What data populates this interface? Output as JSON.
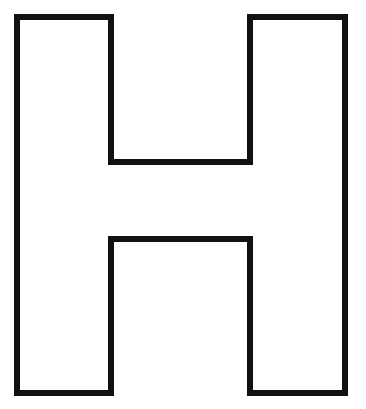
{
  "image": {
    "subject": "Outlined block letter",
    "letter": "H",
    "stroke_color": "#111111",
    "fill_color": "#ffffff",
    "background": "#ffffff",
    "stroke_width": 6
  }
}
